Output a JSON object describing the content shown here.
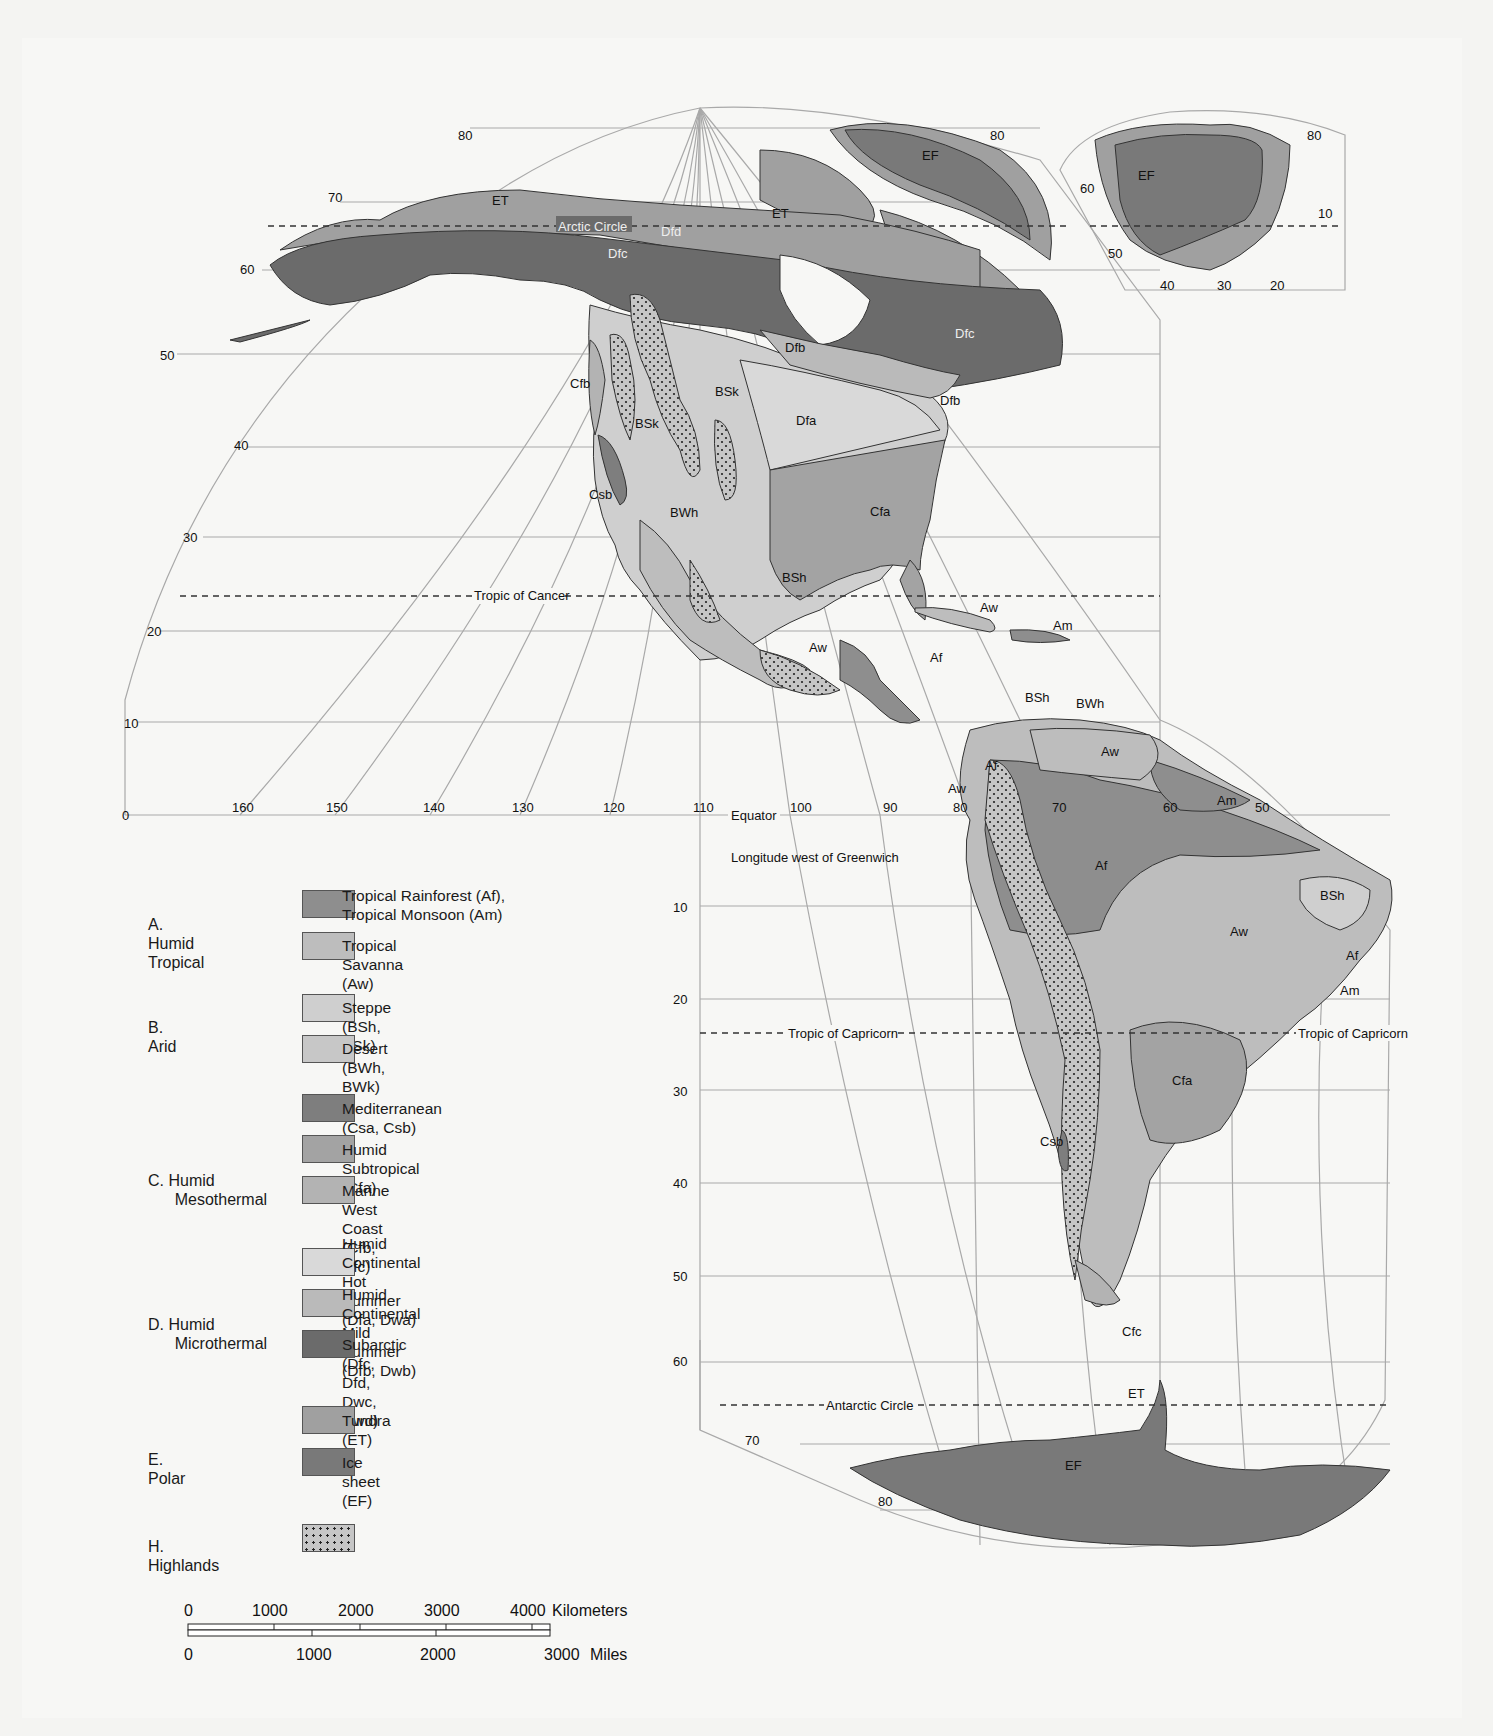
{
  "map": {
    "title_hidden": "Climate regions of the Americas (Köppen classification)",
    "latitudes_north_left": [
      "80",
      "70",
      "60",
      "50",
      "40",
      "30",
      "20",
      "10",
      "0"
    ],
    "longitudes_bottom": [
      "160",
      "150",
      "140",
      "130",
      "120",
      "110",
      "100",
      "90",
      "80",
      "70",
      "60",
      "50"
    ],
    "greenland_inset": {
      "lat_labels": [
        "80",
        "60",
        "50"
      ],
      "lon_labels": [
        "40",
        "30",
        "20",
        "10"
      ],
      "region": "EF"
    },
    "south_lat_labels": [
      "10",
      "20",
      "30",
      "40",
      "50",
      "60",
      "70",
      "80"
    ],
    "lines": {
      "arctic_circle": "Arctic Circle",
      "tropic_cancer": "Tropic of Cancer",
      "equator": "Equator",
      "tropic_capricorn_left": "Tropic of Capricorn",
      "tropic_capricorn_right": "Tropic of Capricorn",
      "antarctic_circle": "Antarctic Circle",
      "longitude_note": "Longitude west of Greenwich"
    },
    "region_labels": {
      "et_alaska": "ET",
      "et_canada": "ET",
      "ef_ellesmere": "EF",
      "ef_greenland": "EF",
      "dfd": "Dfd",
      "dfc_yukon": "Dfc",
      "dfc_quebec": "Dfc",
      "dfb_west": "Dfb",
      "dfb_east": "Dfb",
      "dfa": "Dfa",
      "cfa_na": "Cfa",
      "cfb": "Cfb",
      "bsk_1": "BSk",
      "bsk_2": "BSk",
      "csb_na": "Csb",
      "bwh_na": "BWh",
      "bsh_mex": "BSh",
      "aw_mex": "Aw",
      "af_ca": "Af",
      "aw_cuba": "Aw",
      "am_carib": "Am",
      "bsh_ven": "BSh",
      "bwh_ven": "BWh",
      "aw_ven": "Aw",
      "af_col": "Af",
      "aw_ecu": "Aw",
      "am_guiana": "Am",
      "af_amazon": "Af",
      "bsh_brazil": "BSh",
      "aw_brazil": "Aw",
      "af_brazil": "Af",
      "am_brazil": "Am",
      "cfa_sa": "Cfa",
      "csb_sa": "Csb",
      "cfc": "Cfc",
      "et_ant": "ET",
      "ef_ant": "EF"
    }
  },
  "legend": {
    "groups": [
      {
        "label": "A. Humid Tropical",
        "items": [
          {
            "label": "Tropical Rainforest (Af),\nTropical Monsoon (Am)",
            "color": "#8e8e8e"
          },
          {
            "label": "Tropical Savanna (Aw)",
            "color": "#bdbdbd"
          }
        ]
      },
      {
        "label": "B. Arid",
        "items": [
          {
            "label": "Steppe (BSh, BSk)",
            "color": "#cfcfcf"
          },
          {
            "label": "Desert (BWh, BWk)",
            "color": "#c7c7c7"
          }
        ]
      },
      {
        "label": "C. Humid\n      Mesothermal",
        "items": [
          {
            "label": "Mediterranean (Csa, Csb)",
            "color": "#7e7e7e"
          },
          {
            "label": "Humid Subtropical (Cfa)",
            "color": "#a3a3a3"
          },
          {
            "label": "Marine West Coast (Cfb, Cfc)",
            "color": "#b3b3b3"
          }
        ]
      },
      {
        "label": "D. Humid\n      Microthermal",
        "items": [
          {
            "label": "Humid Continental Hot Summer\n(Dfa, Dwa)",
            "color": "#d9d9d9"
          },
          {
            "label": "Humid Continental Mild Summer\n(Dfb, Dwb)",
            "color": "#bababa"
          },
          {
            "label": "Subarctic (Dfc, Dfd, Dwc, Dwd)",
            "color": "#6b6b6b"
          }
        ]
      },
      {
        "label": "E. Polar",
        "items": [
          {
            "label": "Tundra (ET)",
            "color": "#a0a0a0"
          },
          {
            "label": "Ice sheet (EF)",
            "color": "#797979"
          }
        ]
      },
      {
        "label": "H. Highlands",
        "items": [
          {
            "label": "",
            "color": "#c2c2c2",
            "pattern": "dots"
          }
        ]
      }
    ]
  },
  "scale_bar": {
    "km_ticks": [
      "0",
      "1000",
      "2000",
      "3000",
      "4000"
    ],
    "km_unit": "Kilometers",
    "mi_ticks": [
      "0",
      "1000",
      "2000",
      "3000"
    ],
    "mi_unit": "Miles"
  }
}
